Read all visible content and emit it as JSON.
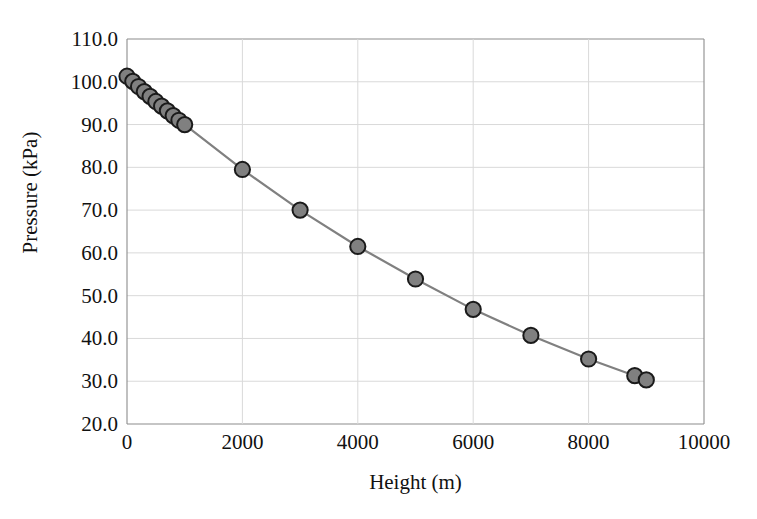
{
  "chart_data": {
    "type": "line",
    "title": "",
    "xlabel": "Height (m)",
    "ylabel": "Pressure (kPa)",
    "xlim": [
      0,
      10000
    ],
    "ylim": [
      20.0,
      110.0
    ],
    "xticks": [
      "0",
      "2000",
      "4000",
      "6000",
      "8000",
      "10000"
    ],
    "xtick_values": [
      0,
      2000,
      4000,
      6000,
      8000,
      10000
    ],
    "yticks": [
      "20.0",
      "30.0",
      "40.0",
      "50.0",
      "60.0",
      "70.0",
      "80.0",
      "90.0",
      "100.0",
      "110.0"
    ],
    "ytick_values": [
      20.0,
      30.0,
      40.0,
      50.0,
      60.0,
      70.0,
      80.0,
      90.0,
      100.0,
      110.0
    ],
    "grid": true,
    "legend": false,
    "marker": "circle",
    "marker_fill": "#808080",
    "marker_edge": "#1a1a1a",
    "line_color": "#808080",
    "grid_color": "#d9d9d9",
    "axis_color": "#8c8c8c",
    "background": "#ffffff",
    "series": [
      {
        "name": "Pressure vs Height",
        "x": [
          0,
          100,
          200,
          300,
          400,
          500,
          600,
          700,
          800,
          900,
          1000,
          2000,
          3000,
          4000,
          5000,
          6000,
          7000,
          8000,
          8800,
          9000
        ],
        "y": [
          101.3,
          100.1,
          98.9,
          97.7,
          96.6,
          95.4,
          94.3,
          93.2,
          92.1,
          91.0,
          90.0,
          79.5,
          70.0,
          61.5,
          53.9,
          46.8,
          40.7,
          35.2,
          31.3,
          30.3
        ]
      }
    ]
  }
}
